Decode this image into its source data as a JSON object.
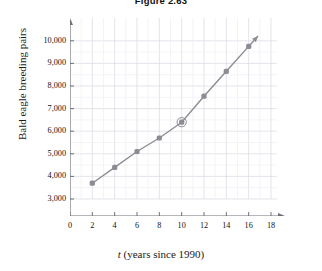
{
  "title": "Figure 2.63",
  "chart_data": {
    "type": "scatter",
    "title": "Figure 2.63",
    "xlabel": "t (years since 1990)",
    "xlabel_var": "t",
    "xlabel_rest": " (years since 1990)",
    "ylabel": "Bald eagle breeding pairs",
    "x": [
      2,
      4,
      6,
      8,
      10,
      12,
      14,
      16
    ],
    "values": [
      3700,
      4400,
      5100,
      5700,
      6400,
      7550,
      8650,
      9750
    ],
    "xlim": [
      0,
      18
    ],
    "ylim": [
      3000,
      10000
    ],
    "y_axis_broken": true,
    "grid": true,
    "legend": "none",
    "xticks": [
      "0",
      "2",
      "4",
      "6",
      "8",
      "10",
      "12",
      "14",
      "16",
      "18"
    ],
    "xtick_values": [
      0,
      2,
      4,
      6,
      8,
      10,
      12,
      14,
      16,
      18
    ],
    "yticks": [
      "3,000",
      "4,000",
      "5,000",
      "6,000",
      "7,000",
      "8,000",
      "9,000",
      "10,000"
    ],
    "ytick_values": [
      3000,
      4000,
      5000,
      6000,
      7000,
      8000,
      9000,
      10000
    ],
    "series_color": "#8c8c94",
    "grid_color": "#d9d9e2",
    "axis_color": "#6f6f78",
    "annotations": [
      {
        "name": "highlight-circle",
        "x": 10,
        "y": 6400
      }
    ],
    "trend_arrow": true
  }
}
